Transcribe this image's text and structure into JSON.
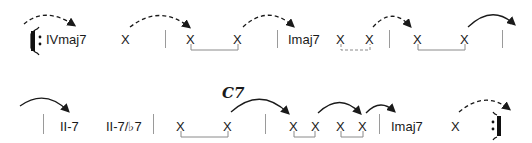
{
  "row1": {
    "chords": [
      {
        "label": "IVmaj7",
        "x": 46,
        "y": 33
      },
      {
        "label": "X",
        "x": 121,
        "y": 33
      },
      {
        "label": "X",
        "x": 186,
        "y": 33
      },
      {
        "label": "X",
        "x": 233,
        "y": 33
      },
      {
        "label": "Imaj7",
        "x": 288,
        "y": 33
      },
      {
        "label": "X",
        "x": 336,
        "y": 33
      },
      {
        "label": "X",
        "x": 365,
        "y": 33
      },
      {
        "label": "X",
        "x": 413,
        "y": 33
      },
      {
        "label": "X",
        "x": 460,
        "y": 33
      }
    ]
  },
  "row2": {
    "chords": [
      {
        "label": "II-7",
        "x": 60,
        "y": 120
      },
      {
        "label": "II-7/♭7",
        "x": 106,
        "y": 120
      },
      {
        "label": "X",
        "x": 176,
        "y": 120
      },
      {
        "label": "X",
        "x": 223,
        "y": 120
      },
      {
        "label": "X",
        "x": 289,
        "y": 120
      },
      {
        "label": "X",
        "x": 311,
        "y": 120
      },
      {
        "label": "X",
        "x": 336,
        "y": 120
      },
      {
        "label": "X",
        "x": 358,
        "y": 120
      },
      {
        "label": "Imaj7",
        "x": 391,
        "y": 120
      },
      {
        "label": "X",
        "x": 451,
        "y": 120
      }
    ],
    "annotation": "C7"
  },
  "colors": {
    "ink": "#1a1a1a",
    "barline": "#9a9a9a",
    "bracket": "#8a8a8a"
  }
}
